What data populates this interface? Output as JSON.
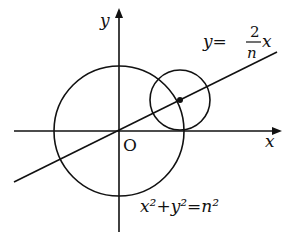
{
  "diagram": {
    "axes": {
      "x_label": "x",
      "y_label": "y",
      "origin_label": "O"
    },
    "line": {
      "eq_lhs": "y=",
      "numerator": "2",
      "denominator": "n",
      "var": "x"
    },
    "circle": {
      "eq": "x²+y²=n²"
    },
    "colors": {
      "stroke": "#111111",
      "background": "#ffffff"
    }
  }
}
